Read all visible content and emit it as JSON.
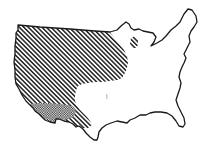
{
  "map": {
    "subject": "Contiguous United States outline",
    "background": "#ffffff",
    "outline_color": "#1a1a1a",
    "regions": [
      {
        "name": "western-region",
        "pattern": "diagonal-hatch",
        "color": "#222222"
      },
      {
        "name": "southwest-region",
        "pattern": "checkered-stipple",
        "color": "#222222"
      },
      {
        "name": "great-lakes-region",
        "pattern": "diagonal-hatch",
        "color": "#222222"
      }
    ]
  }
}
